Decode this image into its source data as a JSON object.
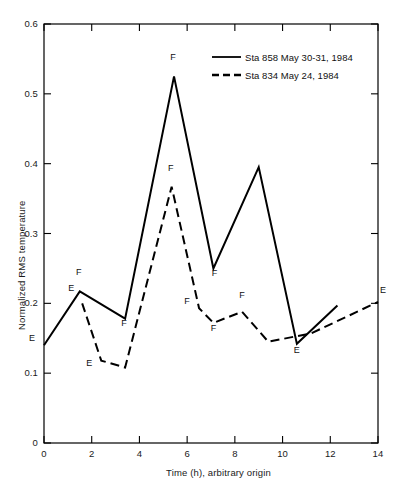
{
  "chart_data": {
    "type": "line",
    "title": "",
    "xlabel": "Time (h), arbitrary origin",
    "ylabel": "Normalized RMS temperature",
    "xlim": [
      0,
      14
    ],
    "ylim": [
      0,
      0.6
    ],
    "xticks": [
      0,
      2,
      4,
      6,
      8,
      10,
      12,
      14
    ],
    "xtick_labels": [
      "0",
      "2",
      "4",
      "6",
      "8",
      "10",
      "12",
      "14"
    ],
    "yticks": [
      0,
      0.1,
      0.2,
      0.3,
      0.4,
      0.5,
      0.6
    ],
    "ytick_labels": [
      "0",
      "0.1",
      "0.2",
      "0.3",
      "0.4",
      "0.5",
      "0.6"
    ],
    "grid": false,
    "legend_position": "top-right",
    "series": [
      {
        "name": "Sta 858 May 30-31, 1984",
        "style": "solid",
        "color": "#000000",
        "x": [
          0.0,
          1.5,
          3.4,
          5.45,
          7.1,
          9.0,
          10.6,
          12.3
        ],
        "y": [
          0.14,
          0.217,
          0.178,
          0.525,
          0.25,
          0.395,
          0.142,
          0.197
        ],
        "point_labels": [
          "E",
          "F",
          "F",
          "F",
          "F",
          "",
          "E",
          ""
        ]
      },
      {
        "name": "Sta 834 May 24, 1984",
        "style": "dashed",
        "color": "#000000",
        "x": [
          1.6,
          2.4,
          3.4,
          5.35,
          6.5,
          7.1,
          8.3,
          9.4,
          11.2,
          14.0
        ],
        "y": [
          0.2,
          0.118,
          0.108,
          0.367,
          0.193,
          0.172,
          0.188,
          0.145,
          0.157,
          0.202
        ],
        "point_labels": [
          "E",
          "E",
          "",
          "F",
          "F",
          "F",
          "F",
          "",
          "",
          "E"
        ]
      }
    ]
  },
  "legend": {
    "entries": [
      {
        "label": "Sta 858 May 30-31, 1984",
        "style": "solid"
      },
      {
        "label": "Sta 834 May 24, 1984",
        "style": "dashed"
      }
    ]
  },
  "axes": {
    "x_title": "Time (h), arbitrary origin",
    "y_title": "Normalized RMS temperature"
  }
}
